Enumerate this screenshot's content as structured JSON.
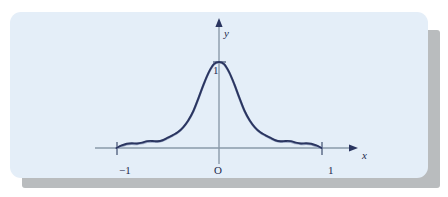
{
  "figure": {
    "panel_color": "#e4eef8",
    "shadow_color": "#b9bcbe",
    "axis_color": "#8a9aaa",
    "curve_color": "#2a3560",
    "curve_secondary_color": "#9aa7c4",
    "label_color": "#1f2a4d"
  },
  "labels": {
    "y_axis": "y",
    "x_axis": "x",
    "origin": "O",
    "y_tick_1": "1",
    "x_tick_neg1": "−1",
    "x_tick_pos1": "1"
  },
  "chart_data": {
    "type": "line",
    "title": "",
    "xlabel": "x",
    "ylabel": "y",
    "xlim": [
      -1.3,
      1.4
    ],
    "ylim": [
      -0.12,
      1.25
    ],
    "grid": false,
    "legend": false,
    "xticks": [
      -1,
      0,
      1
    ],
    "xticklabels": [
      "−1",
      "O",
      "1"
    ],
    "yticks": [
      1
    ],
    "yticklabels": [
      "1"
    ],
    "annotations": [
      "peak at (0, 1)"
    ],
    "series": [
      {
        "name": "main-curve",
        "color": "#2a3560",
        "x": [
          -1.0,
          -0.95,
          -0.9,
          -0.85,
          -0.8,
          -0.75,
          -0.7,
          -0.65,
          -0.6,
          -0.55,
          -0.5,
          -0.45,
          -0.4,
          -0.35,
          -0.3,
          -0.25,
          -0.2,
          -0.15,
          -0.1,
          -0.05,
          0.0,
          0.05,
          0.1,
          0.15,
          0.2,
          0.25,
          0.3,
          0.35,
          0.4,
          0.45,
          0.5,
          0.55,
          0.6,
          0.65,
          0.7,
          0.75,
          0.8,
          0.85,
          0.9,
          0.95,
          1.0
        ],
        "y": [
          0.0,
          0.03,
          0.05,
          0.055,
          0.052,
          0.062,
          0.08,
          0.082,
          0.078,
          0.09,
          0.12,
          0.15,
          0.185,
          0.24,
          0.32,
          0.43,
          0.58,
          0.74,
          0.88,
          0.975,
          1.0,
          0.975,
          0.88,
          0.74,
          0.58,
          0.43,
          0.32,
          0.24,
          0.185,
          0.15,
          0.12,
          0.09,
          0.078,
          0.082,
          0.08,
          0.062,
          0.052,
          0.055,
          0.05,
          0.03,
          0.0
        ]
      },
      {
        "name": "secondary-curve",
        "color": "#9aa7c4",
        "x": [
          -1.0,
          -0.95,
          -0.9,
          -0.85,
          -0.8,
          -0.75,
          -0.7,
          -0.65,
          -0.6,
          -0.55,
          -0.5,
          -0.45,
          -0.4,
          -0.35,
          -0.3,
          -0.25,
          -0.2,
          -0.15,
          -0.1,
          -0.05,
          0.0,
          0.05,
          0.1,
          0.15,
          0.2,
          0.25,
          0.3,
          0.35,
          0.4,
          0.45,
          0.5,
          0.55,
          0.6,
          0.65,
          0.7,
          0.75,
          0.8,
          0.85,
          0.9,
          0.95,
          1.0
        ],
        "y": [
          0.0,
          0.022,
          0.042,
          0.048,
          0.046,
          0.056,
          0.072,
          0.075,
          0.072,
          0.086,
          0.115,
          0.146,
          0.182,
          0.238,
          0.318,
          0.428,
          0.578,
          0.738,
          0.878,
          0.973,
          0.998,
          0.973,
          0.878,
          0.738,
          0.578,
          0.428,
          0.318,
          0.238,
          0.182,
          0.146,
          0.115,
          0.086,
          0.072,
          0.075,
          0.072,
          0.056,
          0.046,
          0.048,
          0.042,
          0.022,
          0.0
        ]
      }
    ]
  }
}
